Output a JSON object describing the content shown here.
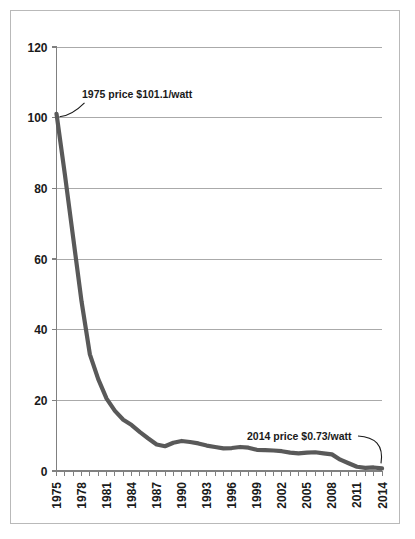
{
  "chart_data": {
    "type": "line",
    "title": "",
    "xlabel": "",
    "ylabel": "",
    "xlim": [
      1975,
      2014
    ],
    "ylim": [
      0,
      120
    ],
    "grid": true,
    "legend": "none",
    "line_color": "#595959",
    "gridline_color": "#aaaaaa",
    "axis_color": "#808080",
    "background": "#ffffff",
    "ytick_labels": [
      "0",
      "20",
      "40",
      "60",
      "80",
      "100",
      "120"
    ],
    "ytick_values": [
      0,
      20,
      40,
      60,
      80,
      100,
      120
    ],
    "xtick_labels": [
      "1975",
      "1978",
      "1981",
      "1984",
      "1987",
      "1990",
      "1993",
      "1996",
      "1999",
      "2002",
      "2005",
      "2008",
      "2011",
      "2014"
    ],
    "xtick_values": [
      1975,
      1978,
      1981,
      1984,
      1987,
      1990,
      1993,
      1996,
      1999,
      2002,
      2005,
      2008,
      2011,
      2014
    ],
    "xtick_minor_step": 1,
    "xtick_label_rotation": -90,
    "x": [
      1975,
      1976,
      1977,
      1978,
      1979,
      1980,
      1981,
      1982,
      1983,
      1984,
      1985,
      1986,
      1987,
      1988,
      1989,
      1990,
      1991,
      1992,
      1993,
      1994,
      1995,
      1996,
      1997,
      1998,
      1999,
      2000,
      2001,
      2002,
      2003,
      2004,
      2005,
      2006,
      2007,
      2008,
      2009,
      2010,
      2011,
      2012,
      2013,
      2014
    ],
    "values": [
      101.1,
      84.0,
      66.0,
      48.0,
      33.0,
      26.0,
      20.5,
      17.0,
      14.5,
      13.0,
      11.0,
      9.2,
      7.5,
      7.0,
      8.0,
      8.5,
      8.2,
      7.8,
      7.2,
      6.8,
      6.4,
      6.5,
      6.8,
      6.6,
      6.0,
      5.9,
      5.8,
      5.6,
      5.2,
      5.0,
      5.2,
      5.3,
      5.0,
      4.7,
      3.2,
      2.2,
      1.2,
      0.9,
      1.0,
      0.73
    ],
    "series_name": "Solar PV module price ($/watt)",
    "annotations": [
      {
        "id": "annotation-left",
        "text": "1975 price $101.1/watt",
        "x": 1975,
        "y": 101.1
      },
      {
        "id": "annotation-right",
        "text": "2014 price $0.73/watt",
        "x": 2014,
        "y": 0.73
      }
    ]
  }
}
